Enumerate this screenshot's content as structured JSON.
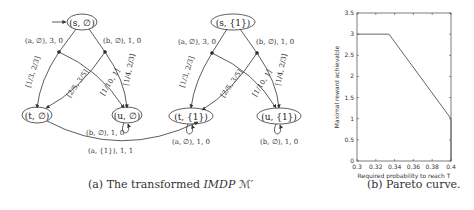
{
  "figure_a": {
    "caption_prefix": "(a) The transformed ",
    "caption_italic": "IMDP",
    "caption_suffix": " ℳ′",
    "left_graph": {
      "nodes": {
        "s": "(s, ∅)",
        "t": "(t, ∅)",
        "u": "(u, ∅)"
      },
      "edges": {
        "a_action": "(a, ∅), 3, 0",
        "b_action": "(b, ∅), 1, 0",
        "interval_1": "[1/3, 2/3]",
        "interval_2": "[2/5, 3/5]",
        "interval_3": "[1/10, 1]",
        "interval_4": "[1/4, 2/3]",
        "u_self": "(b, ∅), 1, 0",
        "t_to_t1": "(a, {1}), 1, 1"
      }
    },
    "right_graph": {
      "nodes": {
        "s": "(s, {1})",
        "t": "(t, {1})",
        "u": "(u, {1})"
      },
      "edges": {
        "a_action": "(a, ∅), 3, 0",
        "b_action": "(b, ∅), 1, 0",
        "interval_1": "[1/3, 2/3]",
        "interval_2": "[2/5, 3/5]",
        "interval_3": "[1/10, 1]",
        "interval_4": "[1/4, 2/3]",
        "t_self": "(a, ∅), 1, 0",
        "u_self": "(b, ∅), 1, 0"
      }
    }
  },
  "figure_b": {
    "caption": "(b) Pareto curve."
  },
  "chart_data": {
    "type": "line",
    "title": "",
    "xlabel": "Required probability to reach T",
    "ylabel": "Maximal reward achievable",
    "xlim": [
      0.3,
      0.4
    ],
    "ylim": [
      0,
      3.5
    ],
    "x_ticks": [
      "0.3",
      "0.32",
      "0.34",
      "0.36",
      "0.38",
      "0.4"
    ],
    "y_ticks": [
      "0",
      "0.5",
      "1",
      "1.5",
      "2",
      "2.5",
      "3",
      "3.5"
    ],
    "grid": false,
    "legend": null,
    "series": [
      {
        "name": "Pareto curve",
        "x": [
          0.3,
          0.334,
          0.4,
          0.4
        ],
        "y": [
          3,
          3,
          1,
          0
        ]
      }
    ]
  }
}
